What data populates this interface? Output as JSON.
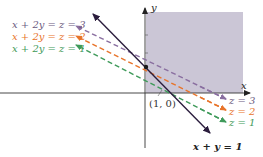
{
  "colors": {
    "region": "#cbc6d6",
    "axis": "#333333",
    "main_line": "#2b1d3d",
    "z3": "#8a6fa0",
    "z2": "#e8742a",
    "z1": "#3f9a5a",
    "text": "#222222"
  },
  "axes": {
    "x_label": "x",
    "y_label": "y"
  },
  "point": {
    "label": "(1, 0)"
  },
  "lines": {
    "main": {
      "label": "x + y = 1"
    },
    "left_labels": [
      {
        "text": "x + 2y = z = 3",
        "color_key": "z3"
      },
      {
        "text": "x + 2y = z = 2",
        "color_key": "z2"
      },
      {
        "text": "x + 2y = z = 1",
        "color_key": "z1"
      }
    ],
    "right_labels": [
      {
        "text": "z = 3",
        "color_key": "z3"
      },
      {
        "text": "z = 2",
        "color_key": "z2"
      },
      {
        "text": "z = 1",
        "color_key": "z1"
      }
    ]
  }
}
